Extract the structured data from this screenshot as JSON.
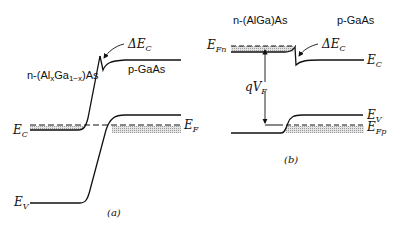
{
  "figure": {
    "panel_a": {
      "caption": "(a)",
      "labels": {
        "n_region": "n-(Al",
        "n_region_sub_x": "x",
        "n_region_mid": "Ga",
        "n_region_sub_1x": "1−x",
        "n_region_end": ")As",
        "p_region": "p-GaAs",
        "delta_ec": "ΔE",
        "delta_ec_sub": "C",
        "ec": "E",
        "ec_sub": "C",
        "ef": "E",
        "ef_sub": "F",
        "ev": "E",
        "ev_sub": "V"
      }
    },
    "panel_b": {
      "caption": "(b)",
      "labels": {
        "n_region": "n-(AlGa)As",
        "p_region": "p-GaAs",
        "efn": "E",
        "efn_sub": "Fn",
        "delta_ec": "ΔE",
        "delta_ec_sub": "C",
        "ec": "E",
        "ec_sub": "C",
        "qvf": "qV",
        "qvf_sub": "F",
        "ev": "E",
        "ev_sub": "V",
        "efp": "E",
        "efp_sub": "Fp"
      }
    },
    "colors": {
      "line": "#111111",
      "shade": "#c8c8c8"
    }
  }
}
